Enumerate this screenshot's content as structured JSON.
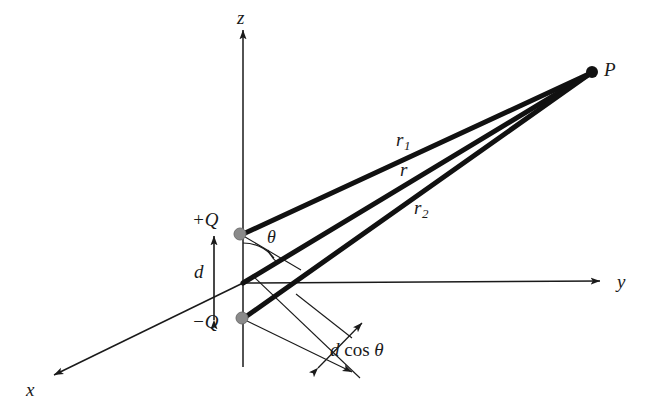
{
  "figure": {
    "kind": "physics-geometry-diagram",
    "background_color": "#ffffff",
    "line_color": "#1a1a1a",
    "charge_dot_color": "#8a8a8a",
    "width": 656,
    "height": 405
  },
  "axes": {
    "z": {
      "label": "z",
      "label_x": 237,
      "label_y": 8
    },
    "y": {
      "label": "y",
      "label_x": 617,
      "label_y": 272
    },
    "x": {
      "label": "x",
      "label_x": 26,
      "label_y": 380
    }
  },
  "points": {
    "field_point": {
      "label": "P",
      "label_x": 604,
      "label_y": 60,
      "dot_x": 592,
      "dot_y": 72
    },
    "positive_charge": {
      "label": "+Q",
      "label_x": 192,
      "label_y": 210,
      "dot_x": 240,
      "dot_y": 234
    },
    "negative_charge": {
      "label": "−Q",
      "label_x": 192,
      "label_y": 312,
      "dot_x": 242,
      "dot_y": 318
    },
    "origin": {
      "x": 243,
      "y": 283
    }
  },
  "distances": {
    "r1": {
      "label": "r",
      "subscript": "1",
      "label_x": 396,
      "label_y": 130
    },
    "r": {
      "label": "r",
      "subscript": "",
      "label_x": 400,
      "label_y": 160
    },
    "r2": {
      "label": "r",
      "subscript": "2",
      "label_x": 414,
      "label_y": 198
    },
    "separation": {
      "label": "d",
      "label_x": 194,
      "label_y": 262
    },
    "projection": {
      "label_italic": "d",
      "label_upright": "cos",
      "label_theta": "θ",
      "label_x": 330,
      "label_y": 340
    }
  },
  "angle": {
    "theta": {
      "label": "θ",
      "label_x": 267,
      "label_y": 228
    }
  }
}
